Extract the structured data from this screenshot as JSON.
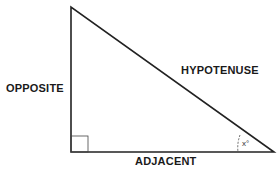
{
  "diagram": {
    "type": "right-triangle",
    "labels": {
      "opposite": "OPPOSITE",
      "hypotenuse": "HYPOTENUSE",
      "adjacent": "ADJACENT",
      "angle": "x°"
    },
    "colors": {
      "stroke": "#222222",
      "text": "#1a1a1a",
      "background": "#ffffff"
    }
  }
}
